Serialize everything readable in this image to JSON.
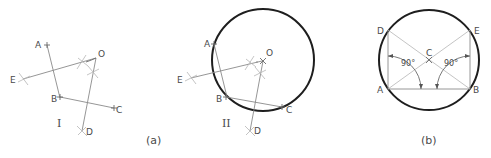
{
  "figure_a": {
    "caption": "(a)",
    "panel_I": {
      "numeral": "I",
      "points": {
        "A": "A",
        "B": "B",
        "C": "C",
        "D": "D",
        "E": "E",
        "O": "O"
      }
    },
    "panel_II": {
      "numeral": "II",
      "points": {
        "A": "A",
        "B": "B",
        "C": "C",
        "D": "D",
        "E": "E",
        "O": "O"
      }
    }
  },
  "figure_b": {
    "caption": "(b)",
    "points": {
      "A": "A",
      "B": "B",
      "C": "C",
      "D": "D",
      "E": "E"
    },
    "angle_left": "90°",
    "angle_right": "90°"
  },
  "colors": {
    "construction_line": "#8a8a8a",
    "circle": "#1e1e1e",
    "label": "#4a4a4a"
  }
}
